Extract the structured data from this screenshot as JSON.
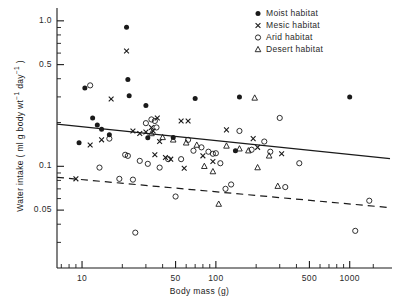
{
  "chart_data": {
    "type": "scatter",
    "title": "",
    "xlabel": "Body mass (g)",
    "ylabel": "Water intake ( ml g body wt⁻¹ day⁻¹ )",
    "xscale": "log",
    "yscale": "log",
    "xlim": [
      6.5,
      2000
    ],
    "ylim": [
      0.02,
      1.15
    ],
    "grid": false,
    "legend_position": "top-right",
    "xticks": [
      {
        "value": 10,
        "label": "10"
      },
      {
        "value": 50,
        "label": "50"
      },
      {
        "value": 100,
        "label": "100"
      },
      {
        "value": 500,
        "label": "500"
      },
      {
        "value": 1000,
        "label": "1000"
      }
    ],
    "yticks": [
      {
        "value": 1.0,
        "label": "1.0"
      },
      {
        "value": 0.5,
        "label": "0.5"
      },
      {
        "value": 0.1,
        "label": "0.1"
      },
      {
        "value": 0.05,
        "label": "0.05"
      }
    ],
    "xminor": [
      7,
      8,
      9,
      20,
      30,
      40,
      60,
      70,
      80,
      90,
      200,
      300,
      400,
      600,
      700,
      800,
      900,
      1500
    ],
    "yminor": [
      0.9,
      0.8,
      0.7,
      0.6,
      0.4,
      0.3,
      0.2,
      0.09,
      0.08,
      0.07,
      0.06,
      0.04,
      0.03,
      0.02
    ],
    "series": [
      {
        "name": "Moist habitat",
        "marker": "filled-circle",
        "color": "#111111",
        "points": [
          [
            9.5,
            0.145
          ],
          [
            10.5,
            0.345
          ],
          [
            12.0,
            0.215
          ],
          [
            13.0,
            0.192
          ],
          [
            14.0,
            0.18
          ],
          [
            16.0,
            0.165
          ],
          [
            21.5,
            0.905
          ],
          [
            22.0,
            0.395
          ],
          [
            22.5,
            0.305
          ],
          [
            30.0,
            0.262
          ],
          [
            31.0,
            0.157
          ],
          [
            48.0,
            0.158
          ],
          [
            70.0,
            0.292
          ],
          [
            140.0,
            0.128
          ],
          [
            150.0,
            0.3
          ],
          [
            1000.0,
            0.3
          ]
        ]
      },
      {
        "name": "Mesic habitat",
        "marker": "cross",
        "color": "#111111",
        "points": [
          [
            9.0,
            0.082
          ],
          [
            11.5,
            0.14
          ],
          [
            14.0,
            0.152
          ],
          [
            16.5,
            0.29
          ],
          [
            21.5,
            0.62
          ],
          [
            24.0,
            0.175
          ],
          [
            27.0,
            0.168
          ],
          [
            30.0,
            0.172
          ],
          [
            33.0,
            0.185
          ],
          [
            34.0,
            0.175
          ],
          [
            35.0,
            0.12
          ],
          [
            36.5,
            0.215
          ],
          [
            38.0,
            0.148
          ],
          [
            42.0,
            0.115
          ],
          [
            46.0,
            0.112
          ],
          [
            55.0,
            0.205
          ],
          [
            58.0,
            0.097
          ],
          [
            62.0,
            0.205
          ],
          [
            80.0,
            0.118
          ],
          [
            95.0,
            0.108
          ],
          [
            120.0,
            0.178
          ],
          [
            190.0,
            0.155
          ],
          [
            205.0,
            0.135
          ],
          [
            310.0,
            0.122
          ]
        ]
      },
      {
        "name": "Arid habitat",
        "marker": "open-circle",
        "color": "#111111",
        "points": [
          [
            11.5,
            0.36
          ],
          [
            13.5,
            0.098
          ],
          [
            16.0,
            0.155
          ],
          [
            19.0,
            0.082
          ],
          [
            21.0,
            0.12
          ],
          [
            22.0,
            0.118
          ],
          [
            24.0,
            0.081
          ],
          [
            25.0,
            0.035
          ],
          [
            27.0,
            0.109
          ],
          [
            30.0,
            0.198
          ],
          [
            31.0,
            0.104
          ],
          [
            33.0,
            0.21
          ],
          [
            35.0,
            0.205
          ],
          [
            36.0,
            0.185
          ],
          [
            38.0,
            0.098
          ],
          [
            44.0,
            0.112
          ],
          [
            50.0,
            0.062
          ],
          [
            55.0,
            0.112
          ],
          [
            62.0,
            0.152
          ],
          [
            68.0,
            0.128
          ],
          [
            78.0,
            0.135
          ],
          [
            88.0,
            0.126
          ],
          [
            95.0,
            0.122
          ],
          [
            100.0,
            0.123
          ],
          [
            108.0,
            0.105
          ],
          [
            118.0,
            0.07
          ],
          [
            130.0,
            0.075
          ],
          [
            150.0,
            0.175
          ],
          [
            185.0,
            0.13
          ],
          [
            230.0,
            0.148
          ],
          [
            255.0,
            0.126
          ],
          [
            300.0,
            0.215
          ],
          [
            330.0,
            0.072
          ],
          [
            420.0,
            0.105
          ],
          [
            1100.0,
            0.036
          ],
          [
            1400.0,
            0.058
          ]
        ]
      },
      {
        "name": "Desert habitat",
        "marker": "triangle",
        "color": "#111111",
        "points": [
          [
            33.0,
            0.168
          ],
          [
            40.0,
            0.158
          ],
          [
            48.0,
            0.152
          ],
          [
            60.0,
            0.145
          ],
          [
            72.0,
            0.14
          ],
          [
            82.0,
            0.1
          ],
          [
            95.0,
            0.092
          ],
          [
            105.0,
            0.055
          ],
          [
            120.0,
            0.138
          ],
          [
            150.0,
            0.132
          ],
          [
            175.0,
            0.128
          ],
          [
            195.0,
            0.295
          ],
          [
            205.0,
            0.098
          ],
          [
            250.0,
            0.118
          ],
          [
            290.0,
            0.073
          ]
        ]
      }
    ],
    "fits": [
      {
        "name": "solid-regression",
        "style": "solid",
        "x0": 6.5,
        "y0": 0.195,
        "x1": 2000,
        "y1": 0.113
      },
      {
        "name": "dashed-regression",
        "style": "dashed",
        "x0": 6.5,
        "y0": 0.084,
        "x1": 2000,
        "y1": 0.052
      }
    ],
    "legend": [
      {
        "label": "Moist habitat",
        "marker": "filled-circle"
      },
      {
        "label": "Mesic habitat",
        "marker": "cross"
      },
      {
        "label": "Arid habitat",
        "marker": "open-circle"
      },
      {
        "label": "Desert habitat",
        "marker": "triangle"
      }
    ]
  }
}
